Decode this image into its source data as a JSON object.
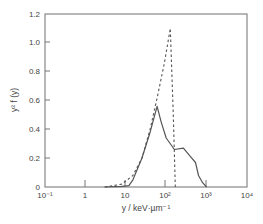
{
  "chart_data": {
    "type": "line",
    "title": "",
    "xlabel": "y / keV·µm⁻¹",
    "ylabel": "y² f (y)",
    "xscale": "log",
    "xlim": [
      0.1,
      10000
    ],
    "ylim": [
      0,
      1.2
    ],
    "grid": false,
    "legend": null,
    "x_ticks": [
      "10⁻¹",
      "1",
      "10",
      "10²",
      "10³",
      "10⁴"
    ],
    "y_ticks": [
      "0",
      "0.2",
      "0.4",
      "0.6",
      "0.8",
      "1.0",
      "1.2"
    ],
    "series": [
      {
        "name": "solid",
        "style": "solid",
        "x": [
          3,
          8,
          11.9,
          15,
          25,
          40,
          59.6,
          75,
          100,
          160,
          266,
          400,
          530,
          630,
          794,
          1000
        ],
        "y": [
          0,
          0.005,
          0.01,
          0.05,
          0.2,
          0.38,
          0.56,
          0.45,
          0.34,
          0.26,
          0.27,
          0.21,
          0.17,
          0.08,
          0.03,
          0
        ]
      },
      {
        "name": "dashed",
        "style": "dashed",
        "x": [
          3,
          8,
          15,
          25,
          40,
          60,
          90,
          126,
          150,
          168
        ],
        "y": [
          0,
          0.02,
          0.08,
          0.2,
          0.4,
          0.62,
          0.86,
          1.1,
          0.5,
          0
        ]
      }
    ]
  },
  "axes": {
    "x_ticks": [
      "10⁻¹",
      "1",
      "10",
      "10²",
      "10³",
      "10⁴"
    ],
    "y_ticks": [
      "0",
      "0.2",
      "0.4",
      "0.6",
      "0.8",
      "1.0",
      "1.2"
    ],
    "xlabel": "y / keV·µm⁻¹",
    "ylabel": "y² f (y)"
  }
}
